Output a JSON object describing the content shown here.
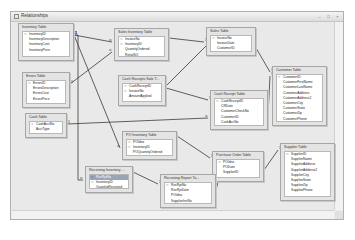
{
  "window": {
    "title": "Relationships",
    "controls": [
      "minimize",
      "maximize",
      "close"
    ]
  },
  "tables": [
    {
      "id": "inventory",
      "title": "Inventory Table",
      "x": 18,
      "y": 23,
      "w": 56,
      "h": 38,
      "fields": [
        {
          "name": "InventoryID",
          "key": true
        },
        {
          "name": "InventoryDescription"
        },
        {
          "name": "InventoryCost"
        },
        {
          "name": "InventoryPrice"
        }
      ]
    },
    {
      "id": "sales_inventory",
      "title": "Sales Inventory Table",
      "x": 114,
      "y": 28,
      "w": 55,
      "h": 33,
      "fields": [
        {
          "name": "InvoiceNo",
          "key": true
        },
        {
          "name": "InventoryID",
          "key": true
        },
        {
          "name": "QuantityOrdered"
        },
        {
          "name": "RetailSO"
        }
      ]
    },
    {
      "id": "sales",
      "title": "Sales Table",
      "x": 206,
      "y": 27,
      "w": 50,
      "h": 29,
      "fields": [
        {
          "name": "InvoiceNo",
          "key": true
        },
        {
          "name": "InvoiceDate"
        },
        {
          "name": "CustomerID"
        }
      ]
    },
    {
      "id": "errors",
      "title": "Errors Table",
      "x": 22,
      "y": 72,
      "w": 48,
      "h": 36,
      "fields": [
        {
          "name": "ErrorsID",
          "key": true
        },
        {
          "name": "ErrorsDescription"
        },
        {
          "name": "ErrorsCost"
        },
        {
          "name": "ErrorsPrice"
        }
      ]
    },
    {
      "id": "cash_receipts_sales",
      "title": "Cash Receipts Sale T...",
      "x": 118,
      "y": 75,
      "w": 48,
      "h": 31,
      "fields": [
        {
          "name": "CashReceiptID",
          "key": true
        },
        {
          "name": "InvoiceNo",
          "key": true
        },
        {
          "name": "AmountApplied"
        }
      ]
    },
    {
      "id": "cash_receipt",
      "title": "Cash Receipt Table",
      "x": 210,
      "y": 90,
      "w": 58,
      "h": 40,
      "fields": [
        {
          "name": "CashReceiptID",
          "key": true
        },
        {
          "name": "CRDate"
        },
        {
          "name": "CustomerCheckNo"
        },
        {
          "name": "CustomerID"
        },
        {
          "name": "CashAccNo"
        }
      ]
    },
    {
      "id": "customer",
      "title": "Customer Table",
      "x": 272,
      "y": 66,
      "w": 55,
      "h": 60,
      "fields": [
        {
          "name": "CustomerID",
          "key": true
        },
        {
          "name": "CustomerFirstName"
        },
        {
          "name": "CustomerLastName"
        },
        {
          "name": "CustomerAddress"
        },
        {
          "name": "CustomerAddress2"
        },
        {
          "name": "CustomerCity"
        },
        {
          "name": "CustomerState"
        },
        {
          "name": "CustomerZip"
        },
        {
          "name": "CustomerPhone"
        }
      ]
    },
    {
      "id": "cash",
      "title": "Cash Table",
      "x": 25,
      "y": 113,
      "w": 42,
      "h": 25,
      "fields": [
        {
          "name": "CashAcctNo",
          "key": true
        },
        {
          "name": "AcctType"
        }
      ]
    },
    {
      "id": "po_inventory",
      "title": "PO Inventory Table",
      "x": 122,
      "y": 131,
      "w": 55,
      "h": 29,
      "fields": [
        {
          "name": "POIdno",
          "key": true
        },
        {
          "name": "InventoryID",
          "key": true
        },
        {
          "name": "POQuantityOrdered"
        }
      ]
    },
    {
      "id": "purchase_order",
      "title": "Purchase Order Table",
      "x": 212,
      "y": 151,
      "w": 52,
      "h": 31,
      "fields": [
        {
          "name": "POIdno",
          "key": true
        },
        {
          "name": "PODate"
        },
        {
          "name": "SupplierID"
        }
      ]
    },
    {
      "id": "supplier",
      "title": "Supplier Table",
      "x": 280,
      "y": 143,
      "w": 55,
      "h": 58,
      "fields": [
        {
          "name": "SupplierID",
          "key": true
        },
        {
          "name": "SupplierName"
        },
        {
          "name": "SupplierAddress"
        },
        {
          "name": "SupplierAddress2"
        },
        {
          "name": "SupplierCity"
        },
        {
          "name": "SupplierState"
        },
        {
          "name": "SupplierZip"
        },
        {
          "name": "SupplierPhone"
        }
      ]
    },
    {
      "id": "receiving_inventory",
      "title": "Receiving Inventory ...",
      "x": 85,
      "y": 166,
      "w": 48,
      "h": 27,
      "fields": [
        {
          "name": "RecRptNo",
          "key": true,
          "selected": true
        },
        {
          "name": "InventoryID",
          "key": true
        },
        {
          "name": "QuantityReceived"
        }
      ]
    },
    {
      "id": "receiving_report",
      "title": "Receiving Report Ta...",
      "x": 160,
      "y": 174,
      "w": 56,
      "h": 34,
      "fields": [
        {
          "name": "RecRptNo",
          "key": true
        },
        {
          "name": "RecRptDate"
        },
        {
          "name": "POIdno"
        },
        {
          "name": "SupplierInvNo"
        }
      ]
    }
  ],
  "relationships": [
    {
      "from": "inventory",
      "to": "sales_inventory",
      "path": "74,35 112,42",
      "one_end": "74,35",
      "many_end": "112,42"
    },
    {
      "from": "inventory",
      "to": "po_inventory",
      "path": "74,35 120,148",
      "one_end": "74,35",
      "many_end": "120,148"
    },
    {
      "from": "errors",
      "to": "sales_inventory",
      "path": "70,84 112,52",
      "one_end": "70,84",
      "many_end": "112,52"
    },
    {
      "from": "sales_inventory",
      "to": "sales",
      "path": "169,38 204,42",
      "one_end": "204,42",
      "many_end": "169,38"
    },
    {
      "from": "sales",
      "to": "cash_receipts_sales",
      "path": "206,46 166,86",
      "one_end": "206,46",
      "many_end": "166,86"
    },
    {
      "from": "sales",
      "to": "customer",
      "path": "256,48 270,72",
      "one_end": "270,72",
      "many_end": "256,48"
    },
    {
      "from": "cash_receipts_sales",
      "to": "cash_receipt",
      "path": "166,88 208,100",
      "one_end": "208,100",
      "many_end": "166,88"
    },
    {
      "from": "cash_receipt",
      "to": "customer",
      "path": "268,115 270,76",
      "one_end": "270,76",
      "many_end": "268,115"
    },
    {
      "from": "cash",
      "to": "cash_receipt",
      "path": "67,124 208,118",
      "one_end": "67,124",
      "many_end": "208,118"
    },
    {
      "from": "po_inventory",
      "to": "purchase_order",
      "path": "177,136 210,158",
      "one_end": "210,158",
      "many_end": "177,136"
    },
    {
      "from": "purchase_order",
      "to": "supplier",
      "path": "264,170 278,150",
      "one_end": "278,150",
      "many_end": "264,170"
    },
    {
      "from": "receiving_inventory",
      "to": "receiving_report",
      "path": "133,172 158,184",
      "one_end": "158,184",
      "many_end": "133,172"
    },
    {
      "from": "receiving_report",
      "to": "purchase_order",
      "path": "216,190 218,182",
      "one_end": "218,182",
      "many_end": "216,190"
    },
    {
      "from": "inventory",
      "to": "receiving_inventory",
      "path": "74,35 78,35 78,180 83,180",
      "one_end": "74,35",
      "many_end": "83,180"
    }
  ],
  "labels": {
    "one": "1",
    "many": "∞"
  }
}
